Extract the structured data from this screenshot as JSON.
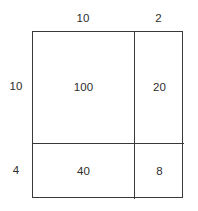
{
  "diagram": {
    "line_color": "#3a3a3a",
    "text_color": "#2d2d2d",
    "background_color": "#ffffff"
  },
  "chart_data": {
    "type": "table",
    "xlabel": "",
    "ylabel": "",
    "grid": true,
    "legend": "none",
    "column_labels": [
      "10",
      "2"
    ],
    "row_labels": [
      "10",
      "4"
    ],
    "cells": [
      [
        "100",
        "20"
      ],
      [
        "40",
        "8"
      ]
    ]
  }
}
